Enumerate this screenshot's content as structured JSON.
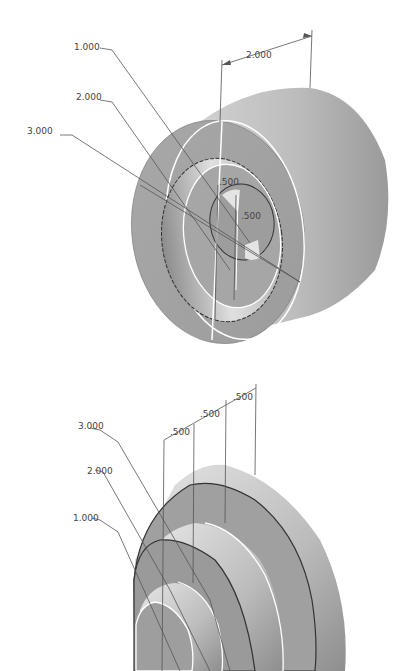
{
  "figures": [
    {
      "name": "bushing-isometric-view",
      "labels": {
        "d1": "1.000",
        "d2": "2.000",
        "d3": "3.000",
        "length": "2.000",
        "inner_a": ".500",
        "inner_b": ".500"
      }
    },
    {
      "name": "stepped-shaft-isometric-view",
      "labels": {
        "d3": "3.000",
        "d2": "2.000",
        "d1": "1.000",
        "step1": ".500",
        "step2": ".500",
        "step3": ".500"
      }
    }
  ],
  "colors": {
    "background": "#ffffff",
    "body_light": "#d8d8d8",
    "body_mid": "#a8a8a8",
    "body_dark": "#8a8a8a",
    "edge": "#333333",
    "highlight_edge": "#ffffff",
    "dim_line": "#555555"
  }
}
